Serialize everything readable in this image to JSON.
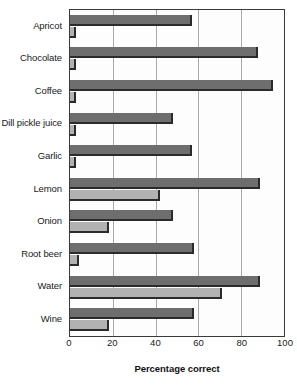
{
  "chart_data": {
    "type": "bar",
    "orientation": "horizontal",
    "title": "",
    "xlabel": "Percentage correct",
    "ylabel": "",
    "xlim": [
      0,
      100
    ],
    "xticks": [
      0,
      20,
      40,
      60,
      80,
      100
    ],
    "grid": true,
    "legend": "none",
    "categories": [
      "Apricot",
      "Chocolate",
      "Coffee",
      "Dill pickle juice",
      "Garlic",
      "Lemon",
      "Onion",
      "Root beer",
      "Water",
      "Wine"
    ],
    "series": [
      {
        "name": "series-1",
        "color": "#6e6e6e",
        "values": [
          57,
          88,
          95,
          48,
          57,
          89,
          48,
          58,
          89,
          58
        ]
      },
      {
        "name": "series-2",
        "color": "#b2b2b2",
        "values": [
          3,
          3,
          3,
          3,
          3,
          42,
          18,
          4,
          71,
          18
        ]
      }
    ]
  },
  "axis": {
    "tick_labels": [
      "0",
      "20",
      "40",
      "60",
      "80",
      "100"
    ]
  }
}
